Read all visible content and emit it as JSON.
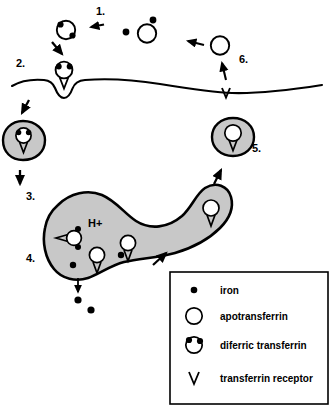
{
  "figure": {
    "background_color": "#ffffff",
    "line_color": "#000000",
    "vesicle_fill_color": "#c8c8c8",
    "endosome_fill_color": "#c8c8c8"
  },
  "steps": [
    {
      "id": "step-1",
      "label": "1."
    },
    {
      "id": "step-2",
      "label": "2."
    },
    {
      "id": "step-3",
      "label": "3."
    },
    {
      "id": "step-4",
      "label": "4."
    },
    {
      "id": "step-5",
      "label": "5."
    },
    {
      "id": "step-6",
      "label": "6."
    }
  ],
  "annotations": {
    "proton_label": "H+"
  },
  "legend": {
    "items": [
      {
        "symbol": "iron-dot-symbol",
        "label": "iron"
      },
      {
        "symbol": "apotransferrin-circle-symbol",
        "label": "apotransferrin"
      },
      {
        "symbol": "diferric-transferrin-symbol",
        "label": "diferric transferrin"
      },
      {
        "symbol": "transferrin-receptor-symbol",
        "label": "transferrin receptor"
      }
    ]
  }
}
